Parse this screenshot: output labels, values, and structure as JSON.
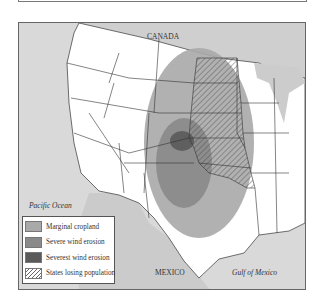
{
  "map": {
    "labels": {
      "canada": "CANADA",
      "pacific": "Pacific Ocean",
      "mexico": "MEXICO",
      "gulf": "Gulf of Mexico"
    },
    "legend": [
      {
        "label": "Marginal cropland",
        "color": "#a9a9a9",
        "pattern": "solid"
      },
      {
        "label": "Severe wind erosion",
        "color": "#8a8a8a",
        "pattern": "solid"
      },
      {
        "label": "Severest wind erosion",
        "color": "#5a5a5a",
        "pattern": "solid"
      },
      {
        "label": "States losing population",
        "color": "#ffffff",
        "pattern": "hatch"
      }
    ],
    "colors": {
      "water": "#d9d9d9",
      "land_us": "#ffffff",
      "land_foreign": "#d0d0d0",
      "border": "#333333"
    }
  }
}
